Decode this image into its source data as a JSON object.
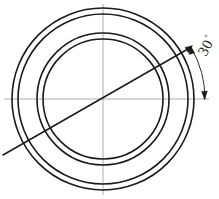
{
  "drawing": {
    "title": "Concentric ring cross-section with 30 degree angular dimension",
    "background_color": "#ffffff",
    "line_color": "#1a1a1a",
    "centerline_color": "#9a9a9a",
    "canvas": {
      "width": 219,
      "height": 199
    },
    "center": {
      "x": 103,
      "y": 99
    }
  },
  "annotations": {
    "angle_value": "30",
    "angle_symbol": "°",
    "angle_degrees": 30,
    "angle_text_rotation": -62
  },
  "chart_data": {
    "type": "scatter",
    "xlabel": "",
    "ylabel": "",
    "center": {
      "x": 103,
      "y": 99
    },
    "circles": [
      {
        "name": "outer-ring-outer-edge",
        "radius": 91,
        "stroke_width": 1.6
      },
      {
        "name": "outer-ring-inner-edge",
        "radius": 85,
        "stroke_width": 1.6
      },
      {
        "name": "inner-ring-outer-edge",
        "radius": 66,
        "stroke_width": 1.6
      },
      {
        "name": "inner-ring-inner-edge",
        "radius": 60,
        "stroke_width": 1.6
      }
    ],
    "centerlines": [
      {
        "name": "horizontal-centerline",
        "x1": 4,
        "y1": 99,
        "x2": 209,
        "y2": 99
      },
      {
        "name": "vertical-centerline",
        "x1": 103,
        "y1": 4,
        "x2": 103,
        "y2": 195
      }
    ],
    "reference_line": {
      "name": "angled-reference-line",
      "x1": 3,
      "y1": 155,
      "x2": 192,
      "y2": 46,
      "angle_from_horizontal": 30
    },
    "dimension_arc": {
      "name": "angle-dimension-arc",
      "center": {
        "x": 103,
        "y": 99
      },
      "radius": 102,
      "start_angle_deg": 0,
      "end_angle_deg": 30,
      "arrowheads": 2
    }
  }
}
